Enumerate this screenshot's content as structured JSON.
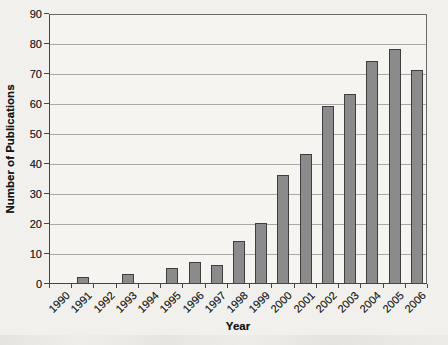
{
  "chart_data": {
    "type": "bar",
    "title": "",
    "xlabel": "Year",
    "ylabel": "Number of Publications",
    "categories": [
      "1990",
      "1991",
      "1992",
      "1993",
      "1994",
      "1995",
      "1996",
      "1997",
      "1998",
      "1999",
      "2000",
      "2001",
      "2002",
      "2003",
      "2004",
      "2005",
      "2006"
    ],
    "values": [
      0,
      2,
      0,
      3,
      0,
      5,
      7,
      6,
      14,
      20,
      36,
      43,
      59,
      63,
      74,
      78,
      71
    ],
    "ylim": [
      0,
      90
    ],
    "ytick_step": 10,
    "yticks": [
      0,
      10,
      20,
      30,
      40,
      50,
      60,
      70,
      80,
      90
    ],
    "grid": true,
    "legend": false,
    "colors": {
      "bar_fill": "#8b8b8b",
      "bar_border": "#3e3e3e",
      "gridline": "#aba9a5",
      "axis": "#454545",
      "background": "#f1f0ec",
      "text": "#1c1c1c"
    }
  }
}
